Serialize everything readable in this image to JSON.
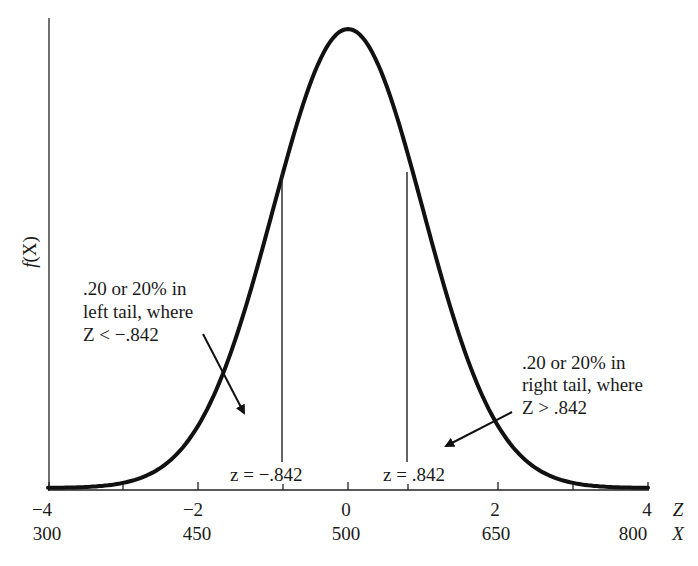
{
  "chart_data": {
    "type": "line",
    "ylabel": "f(X)",
    "xlabel_z": "Z",
    "xlabel_x": "X",
    "mean": 500,
    "sd": 75,
    "z_ticks": [
      {
        "z": -4,
        "label": "−4",
        "x_label": "300"
      },
      {
        "z": -3,
        "label": "",
        "x_label": ""
      },
      {
        "z": -2,
        "label": "−2",
        "x_label": "450"
      },
      {
        "z": 0,
        "label": "0",
        "x_label": "500"
      },
      {
        "z": 2,
        "label": "2",
        "x_label": "650"
      },
      {
        "z": 3,
        "label": "",
        "x_label": ""
      },
      {
        "z": 4,
        "label": "4",
        "x_label": "800"
      }
    ],
    "critical_values": [
      {
        "z": -0.842,
        "label": "z = −.842"
      },
      {
        "z": 0.842,
        "label": "z = .842"
      }
    ],
    "annotations": {
      "left_tail": [
        ".20 or 20% in",
        "left tail, where",
        "Z < −.842"
      ],
      "right_tail": [
        ".20 or 20% in",
        "right tail, where",
        "Z > .842"
      ]
    },
    "xlim": [
      -4,
      4
    ],
    "grid": false
  }
}
